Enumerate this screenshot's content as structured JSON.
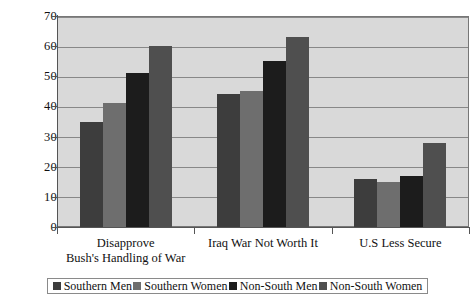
{
  "chart_data": {
    "type": "bar",
    "title": "",
    "subtitle": "",
    "xlabel": "",
    "ylabel": "",
    "ylim": [
      0,
      70
    ],
    "yticks": [
      0,
      10,
      20,
      30,
      40,
      50,
      60,
      70
    ],
    "grid": true,
    "legend_position": "bottom",
    "categories": [
      "Disapprove Bush's Handling of War",
      "Iraq War Not Worth It",
      "U.S Less Secure"
    ],
    "category_lines": [
      [
        "Disapprove",
        "Bush's Handling of War"
      ],
      [
        "Iraq War Not Worth It",
        ""
      ],
      [
        "U.S Less Secure",
        ""
      ]
    ],
    "series": [
      {
        "name": "Southern Men",
        "color": "#3d3d3d",
        "values": [
          35,
          44,
          16
        ]
      },
      {
        "name": "Southern Women",
        "color": "#6e6e6e",
        "values": [
          41,
          45,
          15
        ]
      },
      {
        "name": "Non-South Men",
        "color": "#1c1c1c",
        "values": [
          51,
          55,
          17
        ]
      },
      {
        "name": "Non-South Women",
        "color": "#4f4f4f",
        "values": [
          60,
          63,
          28
        ]
      }
    ],
    "plot_background": "#d9d9d9",
    "gridline_color": "#888888",
    "axis_color": "#555555"
  }
}
